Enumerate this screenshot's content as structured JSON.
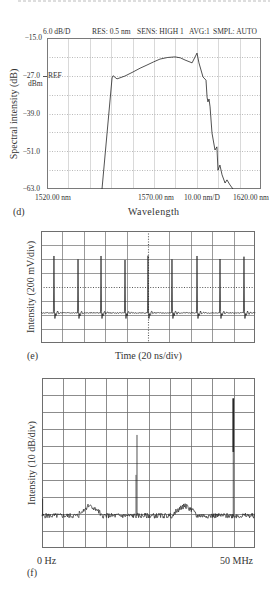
{
  "panels": {
    "d": {
      "label": "(d)",
      "header": {
        "scale": "6.0 dB/D",
        "res": "RES: 0.5 nm",
        "sens": "SENS: HIGH 1",
        "avg_label": "AVG:",
        "avg_value": "1",
        "smpl": "SMPL: AUTO"
      },
      "ylabel": "Spectral intensity (dB)",
      "y_ticks": [
        "−15.0",
        "−27.0",
        "−39.0",
        "−51.0",
        "−63.0"
      ],
      "ref_label": "REF",
      "ref_unit": "dBm",
      "x_ticks": {
        "start": "1520.00 nm",
        "center": "1570.00 nm",
        "span": "10.00 nm/D",
        "stop": "1620.00 nm"
      },
      "xlabel": "Wavelength"
    },
    "e": {
      "label": "(e)",
      "ylabel": "Intensity (200 mV/div)",
      "xlabel": "Time (20 ns/div)"
    },
    "f": {
      "label": "(f)",
      "ylabel": "Intensity (10 dB/div)",
      "x_start": "0 Hz",
      "x_stop": "50 MHz"
    }
  },
  "colors": {
    "background": "#ffffff",
    "text": "#333333",
    "trace": "#262626",
    "frame_d": "#7a7a7a",
    "grid_d": "#cfcfcf",
    "grid_d_dotted": "#a8a8a8",
    "grid_ef": "#6e6e6e",
    "center_ef": "#555555"
  },
  "chart_data": [
    {
      "id": "d",
      "type": "line",
      "title": "",
      "xlabel": "Wavelength",
      "ylabel": "Spectral intensity (dB)",
      "x_unit": "nm",
      "y_unit": "dBm",
      "xlim": [
        1520,
        1620
      ],
      "ylim": [
        -63,
        -15
      ],
      "x_ticks": [
        1520,
        1570,
        1620
      ],
      "x_scale_per_div": 10,
      "y_ticks": [
        -15,
        -27,
        -39,
        -51,
        -63
      ],
      "y_scale_per_div": 6,
      "reference_level": -27,
      "settings": {
        "resolution_nm": 0.5,
        "sensitivity": "HIGH 1",
        "averaging": 1,
        "sampling": "AUTO"
      },
      "grid": {
        "on": true,
        "x_divisions": 10,
        "y_divisions": 8
      },
      "legend": null,
      "series": [
        {
          "name": "optical spectrum",
          "x": [
            1545.7,
            1550.4,
            1550.9,
            1552.7,
            1556.4,
            1560.2,
            1563.5,
            1566.7,
            1569.8,
            1572.8,
            1576.3,
            1579.8,
            1582.3,
            1584.5,
            1587.8,
            1590.1,
            1591.0,
            1592.9,
            1594.3,
            1594.8,
            1595.2,
            1595.7,
            1596.2,
            1597.1,
            1598.5,
            1599.4,
            1599.9,
            1600.8,
            1601.8,
            1603.2,
            1604.1,
            1605.5,
            1606.9
          ],
          "y": [
            -63.0,
            -27.7,
            -27.0,
            -28.0,
            -27.1,
            -25.8,
            -24.6,
            -23.6,
            -22.6,
            -21.7,
            -21.2,
            -21.0,
            -21.3,
            -22.0,
            -22.9,
            -19.8,
            -22.9,
            -27.4,
            -28.4,
            -33.8,
            -35.3,
            -34.4,
            -36.9,
            -45.2,
            -50.6,
            -49.6,
            -57.0,
            -55.4,
            -58.5,
            -61.1,
            -60.1,
            -61.7,
            -63.0
          ]
        }
      ]
    },
    {
      "id": "e",
      "type": "line",
      "title": "",
      "xlabel": "Time (20 ns/div)",
      "ylabel": "Intensity (200 mV/div)",
      "x_unit": "ns",
      "y_unit": "mV relative to screen center",
      "xlim": [
        0,
        200
      ],
      "ylim": [
        -800,
        800
      ],
      "grid": {
        "on": true,
        "x_divisions": 10,
        "y_divisions": 8,
        "center_lines_dotted": true
      },
      "pulse_period_ns": 22.2,
      "baseline_mV": -370,
      "undershoot_mV": -450,
      "ringing_mV": 45,
      "ringing_duration_ns": 7,
      "pulses": {
        "t_ns": [
          12.1,
          34.6,
          56.1,
          78.5,
          100.0,
          122.4,
          145.8,
          167.3,
          189.7
        ],
        "peak_mV": [
          443,
          396,
          443,
          386,
          447,
          396,
          443,
          400,
          433
        ]
      }
    },
    {
      "id": "f",
      "type": "line",
      "title": "",
      "xlabel": "",
      "ylabel": "Intensity (10 dB/div)",
      "x_unit": "MHz",
      "y_unit": "dB relative to top of screen",
      "xlim": [
        0,
        50
      ],
      "ylim": [
        -100,
        0
      ],
      "x_tick_labels": [
        "0 Hz",
        "50 MHz"
      ],
      "grid": {
        "on": true,
        "x_divisions": 10,
        "y_divisions": 10
      },
      "noise_floor_dB": -81,
      "noise_ripple_dB": 3,
      "humps": [
        {
          "from_MHz": 8.7,
          "to_MHz": 13.6,
          "level_dB": -75
        },
        {
          "from_MHz": 31.0,
          "to_MHz": 36.0,
          "level_dB": -75
        }
      ],
      "peaks": [
        {
          "freq_MHz": 0.15,
          "level_dB": -71
        },
        {
          "freq_MHz": 22.3,
          "level_dB": -33.5,
          "secondary_to_dB": -57
        },
        {
          "freq_MHz": 44.9,
          "level_dB": -12,
          "thick_to_dB": -43.5
        }
      ]
    }
  ]
}
